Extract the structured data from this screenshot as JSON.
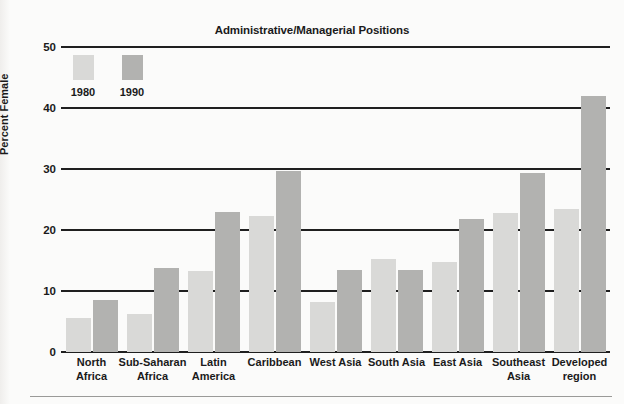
{
  "chart": {
    "title": "Administrative/Managerial Positions",
    "ylabel": "Percent Female"
  },
  "legend": {
    "items": [
      {
        "label": "1980",
        "color": "#d9d9d7"
      },
      {
        "label": "1990",
        "color": "#b2b2b0"
      }
    ]
  },
  "yticks": [
    "0",
    "10",
    "20",
    "30",
    "40",
    "50"
  ],
  "categories_display": [
    [
      "North",
      "Africa"
    ],
    [
      "Sub-Saharan",
      "Africa"
    ],
    [
      "Latin",
      "America"
    ],
    [
      "Caribbean",
      ""
    ],
    [
      "West Asia",
      ""
    ],
    [
      "South Asia",
      ""
    ],
    [
      "East Asia",
      ""
    ],
    [
      "Southeast",
      "Asia"
    ],
    [
      "Developed",
      "region"
    ]
  ],
  "chart_data": {
    "type": "bar",
    "title": "Administrative/Managerial Positions",
    "xlabel": "",
    "ylabel": "Percent Female",
    "ylim": [
      0,
      50
    ],
    "yticks": [
      0,
      10,
      20,
      30,
      40,
      50
    ],
    "grid": true,
    "legend_position": "top-left",
    "categories": [
      "North Africa",
      "Sub-Saharan Africa",
      "Latin America",
      "Caribbean",
      "West Asia",
      "South Asia",
      "East Asia",
      "Southeast Asia",
      "Developed region"
    ],
    "series": [
      {
        "name": "1980",
        "color": "#d9d9d7",
        "values": [
          5.5,
          6.2,
          13.2,
          22.3,
          8.2,
          15.3,
          14.8,
          22.8,
          23.5
        ]
      },
      {
        "name": "1990",
        "color": "#b2b2b0",
        "values": [
          8.5,
          13.7,
          23.0,
          29.7,
          13.5,
          13.5,
          21.8,
          29.3,
          42.0
        ]
      }
    ]
  }
}
